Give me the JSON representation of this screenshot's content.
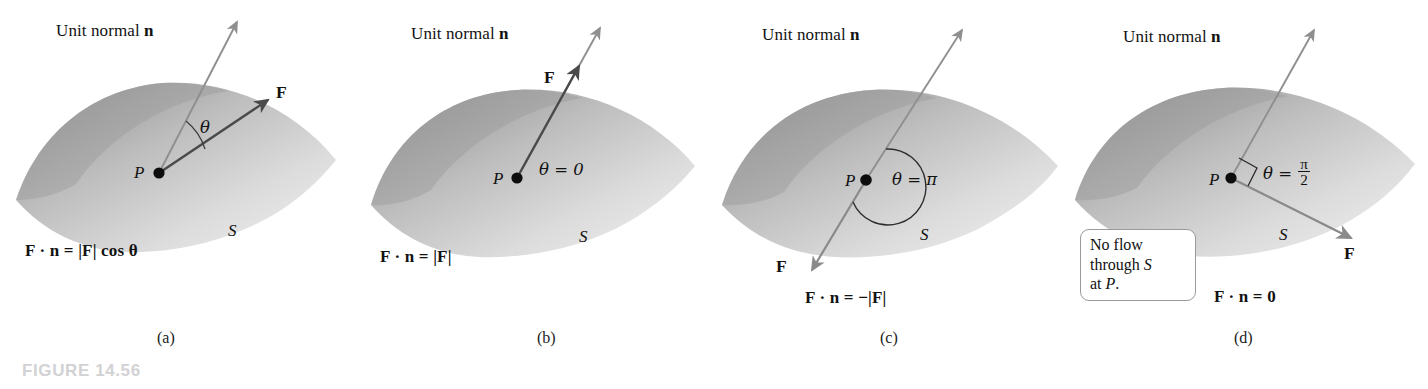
{
  "figure": {
    "number_label": "FIGURE 14.56",
    "unit_normal_label_pre": "Unit normal ",
    "unit_normal_label_vec": "n",
    "point_label": "P",
    "surface_label": "S",
    "force_label": "F"
  },
  "colors": {
    "background": "#ffffff",
    "figure_number": "#d2d2d4",
    "normal_arrow": "#8f8f8f",
    "force_arrow": "#4a4a4a",
    "text": "#121212",
    "surface_dark": "#8c8c8c",
    "surface_light": "#e8e8e8",
    "note_box_border": "#9a9a9a"
  },
  "panels": [
    {
      "id": "a",
      "caption": "(a)",
      "unit_normal_label_pre": "Unit normal ",
      "unit_normal_label_vec": "n",
      "point_label": "P",
      "surface_label": "S",
      "force_label": "F",
      "theta_label": "θ",
      "equation_parts": {
        "lhs": "F · n =",
        "rhs": "|F| cos θ"
      },
      "equation_text": "F · n = |F| cos θ",
      "description": "Force F at angle theta to the unit normal n at point P on surface S"
    },
    {
      "id": "b",
      "caption": "(b)",
      "unit_normal_label_pre": "Unit normal ",
      "unit_normal_label_vec": "n",
      "point_label": "P",
      "surface_label": "S",
      "force_label": "F",
      "theta_label": "θ = 0",
      "equation_parts": {
        "lhs": "F · n =",
        "rhs": "|F|"
      },
      "equation_text": "F · n = |F|",
      "description": "Force F parallel to the unit normal n, theta equals zero"
    },
    {
      "id": "c",
      "caption": "(c)",
      "unit_normal_label_pre": "Unit normal ",
      "unit_normal_label_vec": "n",
      "point_label": "P",
      "surface_label": "S",
      "force_label": "F",
      "theta_label": "θ = π",
      "equation_parts": {
        "lhs": "F · n =",
        "rhs": "−|F|"
      },
      "equation_text": "F · n = −|F|",
      "description": "Force F antiparallel to the unit normal n, theta equals pi"
    },
    {
      "id": "d",
      "caption": "(d)",
      "unit_normal_label_pre": "Unit normal ",
      "unit_normal_label_vec": "n",
      "point_label": "P",
      "surface_label": "S",
      "force_label": "F",
      "theta_label_pre": "θ = ",
      "theta_frac_num": "π",
      "theta_frac_den": "2",
      "theta_label": "θ = π/2",
      "equation_parts": {
        "lhs": "F · n =",
        "rhs": "0"
      },
      "equation_text": "F · n = 0",
      "note_line1": "No flow",
      "note_line2_pre": "through ",
      "note_line2_italic": "S",
      "note_line3_pre": "at ",
      "note_line3_italic": "P",
      "note_line3_post": ".",
      "note_text": "No flow through S at P.",
      "description": "Force F tangent to the surface, perpendicular to n, theta equals pi over 2"
    }
  ]
}
